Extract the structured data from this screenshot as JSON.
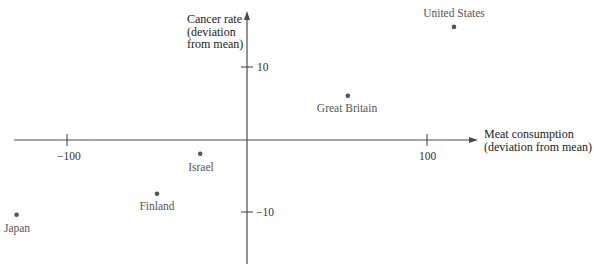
{
  "chart_data": {
    "type": "scatter",
    "title": "",
    "xlabel": "Meat consumption (deviation from mean)",
    "ylabel": "Cancer rate (deviation from mean)",
    "xlabel_lines": [
      "Meat consumption",
      "(deviation from mean)"
    ],
    "ylabel_lines": [
      "Cancer rate",
      "(deviation",
      "from mean)"
    ],
    "xlim": [
      -130,
      127
    ],
    "ylim": [
      -17,
      17.5
    ],
    "x_ticks": [
      -100,
      100
    ],
    "y_ticks": [
      10,
      -10
    ],
    "x_tick_labels": [
      "−100",
      "100"
    ],
    "y_tick_labels": [
      "10",
      "−10"
    ],
    "grid": false,
    "legend": null,
    "points": [
      {
        "label": "United States",
        "x": 115,
        "y": 15.6
      },
      {
        "label": "Great Britain",
        "x": 56,
        "y": 6.1
      },
      {
        "label": "Israel",
        "x": -26,
        "y": -1.9
      },
      {
        "label": "Finland",
        "x": -50,
        "y": -7.4
      },
      {
        "label": "Japan",
        "x": -128,
        "y": -10.3
      }
    ],
    "colors": {
      "axis": "#4a4a4a",
      "point": "#555555",
      "text": "#3a3a3a"
    }
  }
}
